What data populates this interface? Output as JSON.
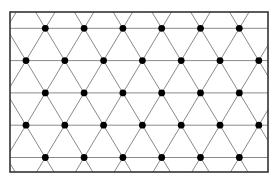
{
  "diagram": {
    "type": "triangular-lattice",
    "frame": {
      "x": 10,
      "y": 12,
      "width": 258,
      "height": 160
    },
    "lattice": {
      "origin_x": 45.3,
      "origin_y": 28.3,
      "dx": 38.8,
      "dy": 32.3,
      "rows": 5,
      "rows_y": [
        28.3,
        60.6,
        92.9,
        125.2,
        157.5
      ],
      "row_dot_x": [
        [
          45.3,
          84.1,
          122.9,
          161.7,
          200.5,
          239.3
        ],
        [
          26.0,
          64.8,
          103.6,
          142.4,
          181.2,
          220.0,
          258.8
        ],
        [
          45.3,
          84.1,
          122.9,
          161.7,
          200.5,
          239.3
        ],
        [
          26.0,
          64.8,
          103.6,
          142.4,
          181.2,
          220.0,
          258.8
        ],
        [
          45.3,
          84.1,
          122.9,
          161.7,
          200.5,
          239.3
        ]
      ]
    },
    "colors": {
      "background": "#ffffff",
      "frame": "#333333",
      "lines": "#8a8a8a",
      "dots": "#000000"
    },
    "dot_radius": 3.4
  }
}
